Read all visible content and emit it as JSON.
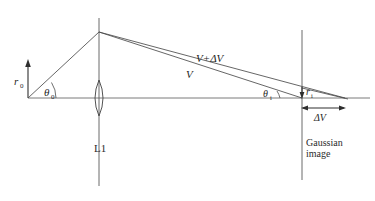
{
  "figure": {
    "background_color": "#ffffff",
    "line_color": "#5a5a5a",
    "text_color": "#1f1f1f",
    "width": 375,
    "height": 201
  },
  "labels": {
    "object_height": {
      "symbol": "r",
      "subscript": "0",
      "text": "r₀",
      "x": 16,
      "y": 82
    },
    "object_angle": {
      "symbol": "θ",
      "subscript": "0",
      "text": "θ₀",
      "x": 44,
      "y": 93
    },
    "lens": {
      "text": "L1",
      "x": 96,
      "y": 150
    },
    "upper_ray": {
      "text": "V+ΔV",
      "x": 197,
      "y": 60
    },
    "lower_ray": {
      "text": "V",
      "x": 187,
      "y": 76
    },
    "image_angle": {
      "symbol": "θ",
      "subscript": "i",
      "text": "θᵢ",
      "x": 264,
      "y": 97
    },
    "image_height": {
      "symbol": "r",
      "subscript": "i",
      "text": "rᵢ",
      "x": 310,
      "y": 93
    },
    "defocus": {
      "text": "ΔV",
      "x": 322,
      "y": 118
    },
    "gaussian_plane": {
      "line1": "Gaussian",
      "line2": "image",
      "x": 307,
      "y": 143
    }
  },
  "geometry": {
    "optical_axis": {
      "x1": 28,
      "y1": 98,
      "x2": 370,
      "y2": 98
    },
    "object_arrow": {
      "x": 28,
      "y_base": 98,
      "y_tip": 62
    },
    "lens_plane": {
      "x": 99,
      "y_top": 18,
      "y_bottom": 186
    },
    "gaussian_plane_line": {
      "x": 302,
      "y_top": 30,
      "y_bottom": 180
    },
    "apex": {
      "x": 99,
      "y": 32
    },
    "incoming_ray": {
      "x1": 28,
      "y1": 98,
      "x2": 99,
      "y2": 32
    },
    "ray_V": {
      "x1": 99,
      "y1": 32,
      "x2": 302,
      "y2": 98
    },
    "ray_V_plus_dV": {
      "x1": 99,
      "y1": 32,
      "x2": 345,
      "y2": 98
    },
    "image_height_marker": {
      "x": 302,
      "y_top": 88,
      "y_bottom": 98
    },
    "defocus_arrow": {
      "x1": 302,
      "x2": 345,
      "y": 108
    }
  },
  "icons": {
    "lens": "biconvex-lens-icon",
    "arrow_up": "up-arrow-icon",
    "arrow_down": "down-arrow-icon",
    "double_arrow": "double-headed-arrow-icon"
  }
}
